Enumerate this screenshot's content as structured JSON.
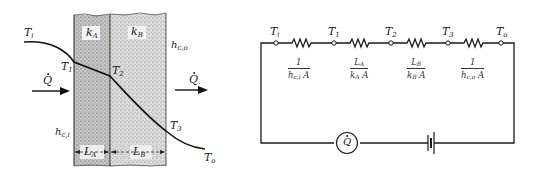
{
  "wall_diagram": {
    "labels": {
      "inner_fluid_temp": {
        "base": "T",
        "sub": "i"
      },
      "inner_surface_temp": {
        "base": "T",
        "sub": "1"
      },
      "interface_temp": {
        "base": "T",
        "sub": "2"
      },
      "outer_surface_temp": {
        "base": "T",
        "sub": "3"
      },
      "outer_fluid_temp": {
        "base": "T",
        "sub": "o"
      },
      "conductivity_a": {
        "base": "k",
        "sub": "A"
      },
      "conductivity_b": {
        "base": "k",
        "sub": "B"
      },
      "inner_convection": {
        "base": "h",
        "sub": "c,i"
      },
      "outer_convection": {
        "base": "h",
        "sub": "c,o"
      },
      "thickness_a": {
        "base": "L",
        "sub": "A"
      },
      "thickness_b": {
        "base": "L",
        "sub": "B"
      },
      "heat_flow_in": "Q",
      "heat_flow_out": "Q"
    },
    "colors": {
      "line": "#1a1a1a",
      "layer_a_fill": "#b9b9b9",
      "layer_b_fill": "#d4d4d4"
    }
  },
  "circuit_diagram": {
    "nodes": [
      {
        "base": "T",
        "sub": "i"
      },
      {
        "base": "T",
        "sub": "1"
      },
      {
        "base": "T",
        "sub": "2"
      },
      {
        "base": "T",
        "sub": "3"
      },
      {
        "base": "T",
        "sub": "o"
      }
    ],
    "resistances": [
      {
        "num": "1",
        "den_base": "h",
        "den_sub": "c,i",
        "den_tail": " A"
      },
      {
        "num_base": "L",
        "num_sub": "A",
        "den_base": "k",
        "den_sub": "A",
        "den_tail": " A"
      },
      {
        "num_base": "L",
        "num_sub": "B",
        "den_base": "k",
        "den_sub": "B",
        "den_tail": " A"
      },
      {
        "num": "1",
        "den_base": "h",
        "den_sub": "c,o",
        "den_tail": " A"
      }
    ],
    "source_label": "Q",
    "colors": {
      "wire": "#1a1a1a"
    }
  }
}
